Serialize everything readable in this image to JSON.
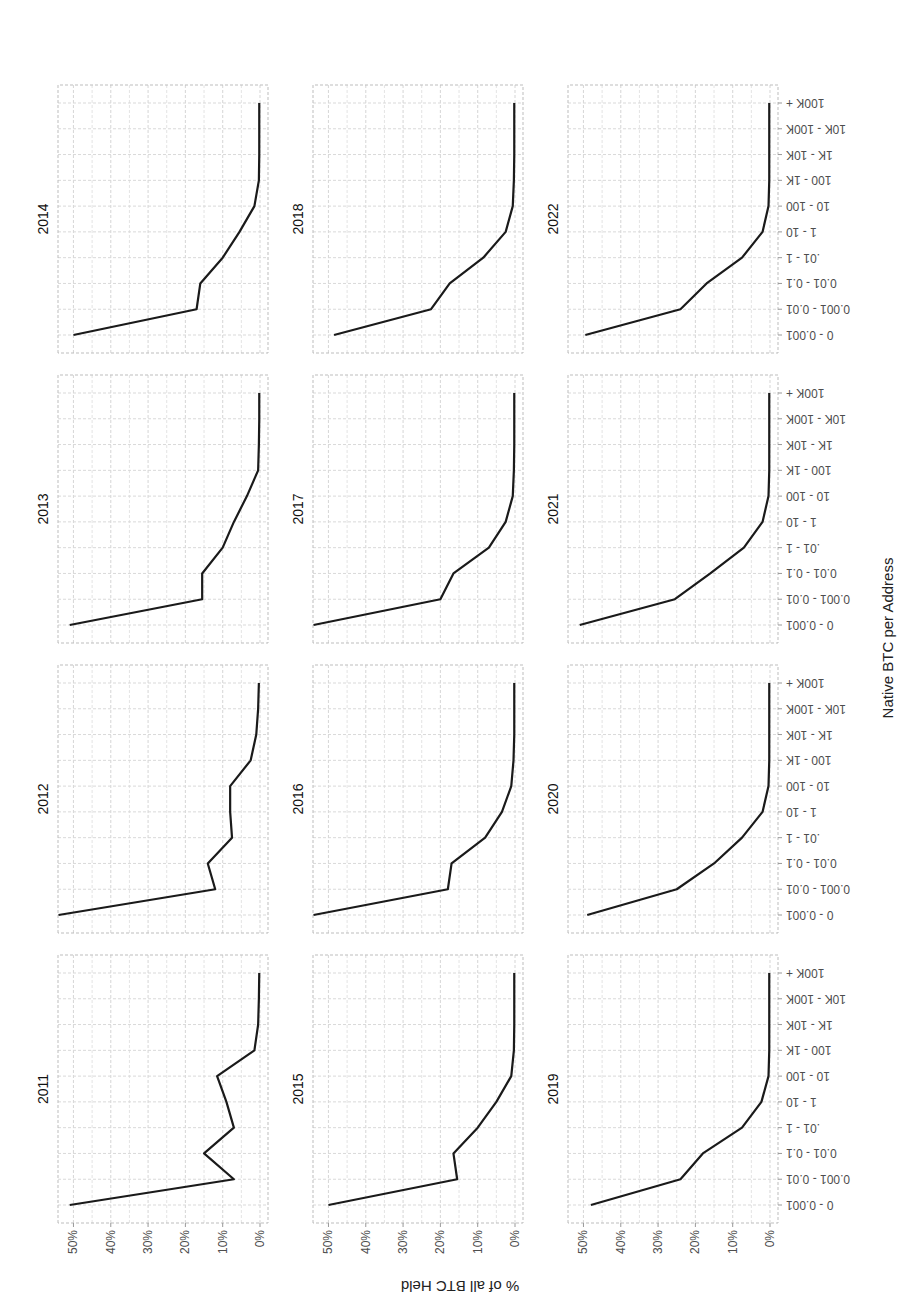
{
  "chart_data": {
    "type": "line",
    "layout": "facet_grid 3 rows x 4 columns, image rotated 90 degrees counter-clockwise",
    "xlabel": "Native BTC per Address",
    "ylabel": "% of all BTC Held",
    "ylim": [
      0,
      52
    ],
    "yticks": [
      "0%",
      "10%",
      "20%",
      "30%",
      "40%",
      "50%"
    ],
    "ytick_values": [
      0,
      10,
      20,
      30,
      40,
      50
    ],
    "grid": true,
    "categories": [
      "0 - 0.001",
      "0.001 - 0.01",
      "0.01 - 0.1",
      ".01 - 1",
      "1 - 10",
      "10 - 100",
      "100 - 1K",
      "1K - 10K",
      "10K - 100K",
      "100K +"
    ],
    "series": [
      {
        "name": "2011",
        "values": [
          51,
          7,
          15,
          7,
          9,
          11.5,
          1.5,
          0.5,
          0.3,
          0.2
        ]
      },
      {
        "name": "2012",
        "values": [
          54,
          12,
          14,
          7.5,
          8,
          8,
          2.5,
          1,
          0.5,
          0.3
        ]
      },
      {
        "name": "2013",
        "values": [
          51,
          15.5,
          15.5,
          10,
          7,
          3.5,
          0.5,
          0.3,
          0.2,
          0.2
        ]
      },
      {
        "name": "2014",
        "values": [
          50,
          17,
          16,
          10,
          5.5,
          1.5,
          0.3,
          0.2,
          0.2,
          0.2
        ]
      },
      {
        "name": "2015",
        "values": [
          50,
          15.5,
          16.5,
          10,
          5,
          1,
          0.3,
          0.2,
          0.2,
          0.2
        ]
      },
      {
        "name": "2016",
        "values": [
          54,
          18,
          17,
          8,
          3.5,
          1,
          0.4,
          0.2,
          0.2,
          0.2
        ]
      },
      {
        "name": "2017",
        "values": [
          54,
          20,
          16.5,
          7,
          2.5,
          0.6,
          0.3,
          0.2,
          0.2,
          0.2
        ]
      },
      {
        "name": "2018",
        "values": [
          48.5,
          22.5,
          17.5,
          8.5,
          2.5,
          0.6,
          0.3,
          0.2,
          0.2,
          0.2
        ]
      },
      {
        "name": "2019",
        "values": [
          48,
          24,
          18,
          7.5,
          2.3,
          0.4,
          0.2,
          0.2,
          0.2,
          0.2
        ]
      },
      {
        "name": "2020",
        "values": [
          49,
          25,
          15,
          7.5,
          2,
          0.4,
          0.2,
          0.2,
          0.2,
          0.2
        ]
      },
      {
        "name": "2021",
        "values": [
          51,
          25.5,
          16,
          7,
          2,
          0.4,
          0.2,
          0.2,
          0.2,
          0.2
        ]
      },
      {
        "name": "2022",
        "values": [
          49.5,
          24,
          17,
          7.5,
          2,
          0.4,
          0.2,
          0.2,
          0.2,
          0.2
        ]
      }
    ]
  },
  "panels": [
    "2011",
    "2012",
    "2013",
    "2014",
    "2015",
    "2016",
    "2017",
    "2018",
    "2019",
    "2020",
    "2021",
    "2022"
  ],
  "colors": {
    "line": "#1a1a1a",
    "grid": "#d9d9d9",
    "panel_border": "#bdbdbd",
    "text": "#4d4d4d"
  }
}
